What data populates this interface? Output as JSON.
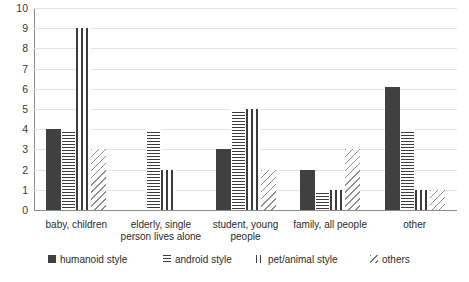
{
  "chart_data": {
    "type": "bar",
    "title": "",
    "subtitle": "",
    "xlabel": "",
    "ylabel": "",
    "ylim": [
      0,
      10
    ],
    "ytick_step": 1,
    "yticks": [
      "10",
      "9",
      "8",
      "7",
      "6",
      "5",
      "4",
      "3",
      "2",
      "1",
      "0"
    ],
    "grid": true,
    "legend_position": "bottom",
    "categories": [
      "baby, children",
      "elderly, single person lives alone",
      "student, young people",
      "family, all people",
      "other"
    ],
    "series": [
      {
        "name": "humanoid style",
        "pattern": "solid",
        "values": [
          4,
          0,
          3,
          2,
          6.1
        ]
      },
      {
        "name": "android style",
        "pattern": "horizontal-lines",
        "values": [
          4,
          4,
          5,
          1,
          4
        ]
      },
      {
        "name": "pet/animal style",
        "pattern": "vertical-lines",
        "values": [
          9,
          2,
          5,
          1,
          1
        ]
      },
      {
        "name": "others",
        "pattern": "diagonal-lines",
        "values": [
          3,
          0,
          2,
          3,
          1
        ]
      }
    ]
  },
  "legend": {
    "items": [
      {
        "label": "humanoid style"
      },
      {
        "label": "android style"
      },
      {
        "label": "pet/animal style"
      },
      {
        "label": "others"
      }
    ]
  },
  "colors": {
    "bar_dark": "#404040",
    "hatch": "#3c3c3c",
    "diagonal": "#8f8f8f",
    "gridline": "#e4e4e4",
    "axis": "#8a8a8a",
    "text": "#2b2b2b",
    "background": "#ffffff"
  }
}
